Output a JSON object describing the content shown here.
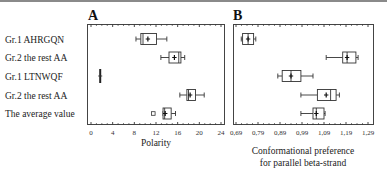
{
  "chart_data": [
    {
      "type": "boxplot",
      "panel": "A",
      "title": "A",
      "xlabel": "Polarity",
      "ylabel": "",
      "xlim": [
        0,
        24
      ],
      "xticks": [
        "0",
        "4",
        "8",
        "12",
        "16",
        "20",
        "24"
      ],
      "xtick_values": [
        0,
        4,
        8,
        12,
        16,
        20,
        24
      ],
      "categories": [
        "Gr.1 AHRGQN",
        "Gr.2 the rest AA",
        "Gr.1 LTNWQF",
        "Gr.2 the rest AA",
        "The average value"
      ],
      "series": [
        {
          "name": "Gr.1 AHRGQN",
          "whisker_low": 8.3,
          "q1": 9.2,
          "median": 9.6,
          "q3": 12.1,
          "whisker_high": 14.0,
          "mean": 10.5,
          "outliers": []
        },
        {
          "name": "Gr.2 the rest AA",
          "whisker_low": 12.9,
          "q1": 14.4,
          "median": 16.2,
          "q3": 16.6,
          "whisker_high": 17.3,
          "mean": 15.4,
          "outliers": []
        },
        {
          "name": "Gr.1 LTNWQF",
          "whisker_low": 1.7,
          "q1": 1.6,
          "median": 1.7,
          "q3": 1.8,
          "whisker_high": 1.7,
          "mean": 1.7,
          "outliers": []
        },
        {
          "name": "Gr.2 the rest AA",
          "whisker_low": 16.4,
          "q1": 17.7,
          "median": 18.0,
          "q3": 19.3,
          "whisker_high": 20.9,
          "mean": 18.3,
          "outliers": []
        },
        {
          "name": "The average value",
          "whisker_low": 13.3,
          "q1": 13.3,
          "median": 13.6,
          "q3": 14.8,
          "whisker_high": 15.6,
          "mean": 13.7,
          "outliers": [
            11.5
          ]
        }
      ]
    },
    {
      "type": "boxplot",
      "panel": "B",
      "title": "B",
      "xlabel": "Conformational preference for parallel beta-strand",
      "xlabel_lines": [
        "Conformational preference",
        "for parallel beta-strand"
      ],
      "ylabel": "",
      "xlim": [
        0.67,
        1.31
      ],
      "xticks": [
        "0,69",
        "0,79",
        "0,89",
        "0,99",
        "1,09",
        "1,19",
        "1,29"
      ],
      "xtick_values": [
        0.69,
        0.79,
        0.89,
        0.99,
        1.09,
        1.19,
        1.29
      ],
      "categories": [
        "Gr.1 AHRGQN",
        "Gr.2 the rest AA",
        "Gr.1 LTNWQF",
        "Gr.2 the rest AA",
        "The average value"
      ],
      "series": [
        {
          "name": "Gr.1 AHRGQN",
          "whisker_low": 0.714,
          "q1": 0.72,
          "median": 0.745,
          "q3": 0.77,
          "whisker_high": 0.78,
          "mean": 0.745,
          "outliers": []
        },
        {
          "name": "Gr.2 the rest AA",
          "whisker_low": 1.1,
          "q1": 1.175,
          "median": 1.195,
          "q3": 1.235,
          "whisker_high": 1.245,
          "mean": 1.195,
          "outliers": []
        },
        {
          "name": "Gr.1 LTNWQF",
          "whisker_low": 0.88,
          "q1": 0.9,
          "median": 0.94,
          "q3": 0.985,
          "whisker_high": 1.04,
          "mean": 0.94,
          "outliers": []
        },
        {
          "name": "Gr.2 the rest AA",
          "whisker_low": 0.985,
          "q1": 1.06,
          "median": 1.12,
          "q3": 1.145,
          "whisker_high": 1.16,
          "mean": 1.1,
          "outliers": []
        },
        {
          "name": "The average value",
          "whisker_low": 0.985,
          "q1": 1.04,
          "median": 1.055,
          "q3": 1.09,
          "whisker_high": 1.095,
          "mean": 1.055,
          "outliers": []
        }
      ]
    }
  ],
  "row_labels": [
    "Gr.1 AHRGQN",
    "Gr.2 the rest AA",
    "Gr.1 LTNWQF",
    "Gr.2 the rest AA",
    "The average value"
  ],
  "panel_a": {
    "title": "A",
    "xlabel": "Polarity"
  },
  "panel_b": {
    "title": "B",
    "xlabel_line1": "Conformational preference",
    "xlabel_line2": "for parallel beta-strand"
  }
}
